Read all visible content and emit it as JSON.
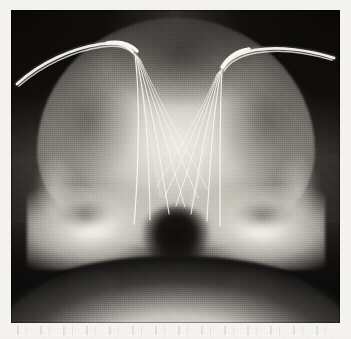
{
  "document": {
    "kind": "medical-radiograph",
    "modality": "X-ray",
    "view": "frontal anteroposterior skull projection",
    "title": "Skull radiograph with bilateral implanted depth electrode arrays",
    "caption_text": "",
    "page_background_color": "#f7f6f3"
  },
  "plate": {
    "label": "radiograph film plate",
    "left_px": 11,
    "top_px": 10,
    "width_px": 329,
    "height_px": 313,
    "film_base_color": "#1c1a18",
    "bone_bright_color": "#eae7e0",
    "air_dark_color": "#0e0d0c"
  },
  "anatomy": [
    {
      "id": "cranial-vault",
      "label": "cranial vault / calvarium",
      "brightness": "bright"
    },
    {
      "id": "frontal-shadow",
      "label": "frontal region soft-tissue shadow",
      "brightness": "dark"
    },
    {
      "id": "petrous-ridge-left",
      "label": "left petrous temporal ridge",
      "brightness": "very bright"
    },
    {
      "id": "petrous-ridge-right",
      "label": "right petrous temporal ridge",
      "brightness": "very bright"
    },
    {
      "id": "orbit-left",
      "label": "left orbit",
      "brightness": "dark"
    },
    {
      "id": "orbit-right",
      "label": "right orbit",
      "brightness": "dark"
    },
    {
      "id": "skull-base-midline",
      "label": "sella / nasal midline structures",
      "brightness": "dark"
    },
    {
      "id": "mandible-neck",
      "label": "mandible and neck soft tissue",
      "brightness": "dark with bright inferior rim"
    }
  ],
  "electrodes": {
    "label": "implanted depth electrode arrays (stereo-EEG)",
    "array_count": 2,
    "arrays": [
      {
        "id": "electrode-array-left",
        "side": "left",
        "strand_count": 6,
        "entry_label": "left parietal burr-hole entry",
        "connector_label": "left external connector lead"
      },
      {
        "id": "electrode-array-right",
        "side": "right",
        "strand_count": 6,
        "entry_label": "right parietal burr-hole entry",
        "connector_label": "right external connector lead"
      }
    ],
    "stroke_color": "#f6f4ef"
  },
  "scan_artifacts": {
    "label": "faint scanner speckle band below the plate",
    "visible": true,
    "opacity": 0.3
  }
}
